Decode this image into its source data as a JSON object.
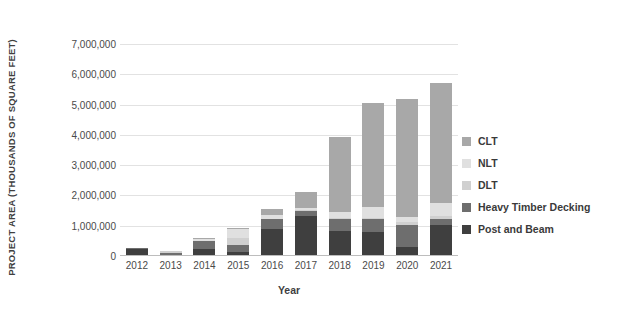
{
  "chart_data": {
    "type": "bar",
    "stacked": true,
    "title": "",
    "xlabel": "Year",
    "ylabel": "PROJECT AREA (THOUSANDS OF SQUARE FEET)",
    "categories": [
      "2012",
      "2013",
      "2014",
      "2015",
      "2016",
      "2017",
      "2018",
      "2019",
      "2020",
      "2021"
    ],
    "ylim": [
      0,
      7000000
    ],
    "yticks": [
      0,
      1000000,
      2000000,
      3000000,
      4000000,
      5000000,
      6000000,
      7000000
    ],
    "ytick_labels": [
      "0",
      "1,000,000",
      "2,000,000",
      "3,000,000",
      "4,000,000",
      "5,000,000",
      "6,000,000",
      "7,000,000"
    ],
    "grid": true,
    "legend_position": "right",
    "series": [
      {
        "name": "Post and Beam",
        "color": "#3f3f3f",
        "values": [
          230000,
          40000,
          230000,
          120000,
          880000,
          1320000,
          810000,
          800000,
          300000,
          1030000
        ]
      },
      {
        "name": "Heavy Timber Decking",
        "color": "#6e6e6e",
        "values": [
          20000,
          60000,
          260000,
          260000,
          330000,
          180000,
          420000,
          430000,
          720000,
          200000
        ]
      },
      {
        "name": "DLT",
        "color": "#d0d0d0",
        "values": [
          0,
          80000,
          0,
          220000,
          10000,
          10000,
          20000,
          40000,
          100000,
          80000
        ]
      },
      {
        "name": "NLT",
        "color": "#e0e0e0",
        "values": [
          0,
          0,
          60000,
          290000,
          150000,
          60000,
          200000,
          360000,
          160000,
          450000
        ]
      },
      {
        "name": "CLT",
        "color": "#a8a8a8",
        "values": [
          0,
          0,
          30000,
          20000,
          180000,
          530000,
          2480000,
          3420000,
          3920000,
          3940000
        ]
      }
    ],
    "totals": [
      250000,
      180000,
      580000,
      910000,
      1550000,
      2100000,
      3930000,
      5050000,
      5200000,
      5700000
    ]
  },
  "legend": {
    "items": [
      {
        "label": "CLT",
        "color": "#a8a8a8"
      },
      {
        "label": "NLT",
        "color": "#e0e0e0"
      },
      {
        "label": "DLT",
        "color": "#d0d0d0"
      },
      {
        "label": "Heavy Timber Decking",
        "color": "#6e6e6e"
      },
      {
        "label": "Post and Beam",
        "color": "#3f3f3f"
      }
    ]
  }
}
